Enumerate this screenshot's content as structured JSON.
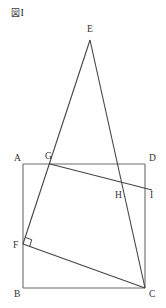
{
  "figure": {
    "caption": "図I",
    "caption_kanji": "図",
    "caption_numeral": "I",
    "type": "geometry-diagram",
    "colors": {
      "stroke": "#444444",
      "square_stroke": "#6b6b6b",
      "text": "#2f2f2f",
      "background": "#ffffff"
    }
  },
  "geometry": {
    "canvas": {
      "width": 166,
      "height": 308
    },
    "points": [
      {
        "id": "A",
        "label": "A",
        "x": 23,
        "y": 164,
        "label_x": 14,
        "label_y": 161,
        "on": "square-top-left"
      },
      {
        "id": "B",
        "label": "B",
        "x": 23,
        "y": 288,
        "label_x": 14,
        "label_y": 297,
        "on": "square-bottom-left"
      },
      {
        "id": "C",
        "label": "C",
        "x": 145,
        "y": 288,
        "label_x": 149,
        "label_y": 297,
        "on": "square-bottom-right"
      },
      {
        "id": "D",
        "label": "D",
        "x": 145,
        "y": 164,
        "label_x": 149,
        "label_y": 161,
        "on": "square-top-right"
      },
      {
        "id": "E",
        "label": "E",
        "x": 90,
        "y": 40,
        "label_x": 87,
        "label_y": 32,
        "on": "apex"
      },
      {
        "id": "F",
        "label": "F",
        "x": 23,
        "y": 244,
        "label_x": 13,
        "label_y": 248,
        "on": "segment-AB"
      },
      {
        "id": "G",
        "label": "G",
        "x": 50,
        "y": 164,
        "label_x": 45,
        "label_y": 159,
        "on": "segment-AD"
      },
      {
        "id": "H",
        "label": "H",
        "x": 121,
        "y": 191,
        "label_x": 115,
        "label_y": 198,
        "on": "intersection-GI-EC"
      },
      {
        "id": "I",
        "label": "I",
        "x": 152,
        "y": 190,
        "label_x": 150,
        "label_y": 198,
        "on": "right-of-square"
      }
    ],
    "square": {
      "id": "ABCD",
      "vertices": [
        "A",
        "D",
        "C",
        "B"
      ]
    },
    "segments": [
      {
        "id": "EF",
        "from": "E",
        "to": "F",
        "note": "passes through G"
      },
      {
        "id": "EC",
        "from": "E",
        "to": "C",
        "note": "passes through H"
      },
      {
        "id": "GI",
        "from": "G",
        "to": "I",
        "note": "crosses EC at H"
      },
      {
        "id": "FC",
        "from": "F",
        "to": "C",
        "note": "fold line"
      }
    ],
    "right_angle": {
      "at": "F",
      "size": 7,
      "note": "right angle mark between FG and FC"
    }
  }
}
